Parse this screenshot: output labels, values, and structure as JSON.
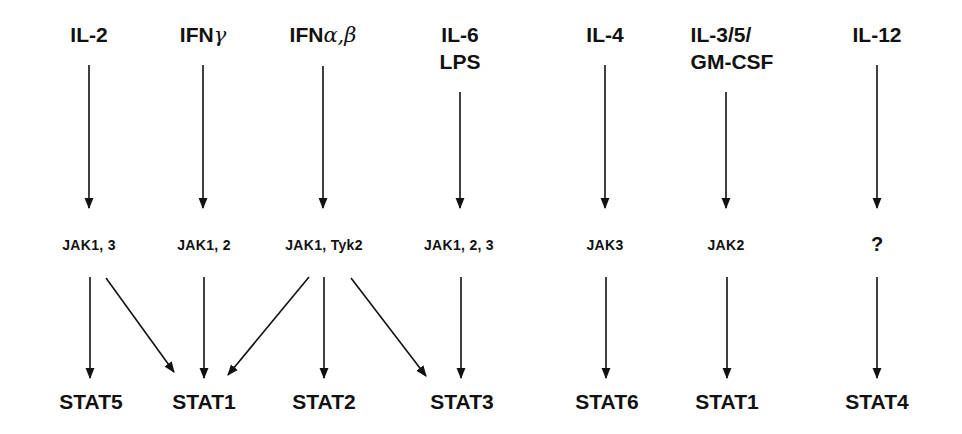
{
  "diagram": {
    "type": "cytokine-jak-stat-signaling",
    "columns": [
      {
        "id": "il2",
        "cytokine": [
          "IL-2"
        ],
        "jak": "JAK1, 3",
        "stats": [
          "STAT5",
          "STAT1"
        ]
      },
      {
        "id": "ifng",
        "cytokine_prefix": "IFN",
        "cytokine_greek": "γ",
        "jak": "JAK1, 2",
        "stats": [
          "STAT1"
        ]
      },
      {
        "id": "ifnab",
        "cytokine_prefix": "IFN",
        "cytokine_greek": "α,β",
        "jak": "JAK1, Tyk2",
        "stats": [
          "STAT1",
          "STAT2",
          "STAT3"
        ]
      },
      {
        "id": "il6",
        "cytokine": [
          "IL-6",
          "LPS"
        ],
        "jak": "JAK1, 2, 3",
        "stats": [
          "STAT3"
        ]
      },
      {
        "id": "il4",
        "cytokine": [
          "IL-4"
        ],
        "jak": "JAK3",
        "stats": [
          "STAT6"
        ]
      },
      {
        "id": "il3",
        "cytokine": [
          "IL-3/5/",
          "GM-CSF"
        ],
        "jak": "JAK2",
        "stats": [
          "STAT1"
        ]
      },
      {
        "id": "il12",
        "cytokine": [
          "IL-12"
        ],
        "jak": "?",
        "stats": [
          "STAT4"
        ]
      }
    ],
    "stat_labels": [
      "STAT5",
      "STAT1",
      "STAT2",
      "STAT3",
      "STAT6",
      "STAT1",
      "STAT4"
    ],
    "edges": [
      {
        "from": "IL-2",
        "to": "JAK1, 3"
      },
      {
        "from": "IFNγ",
        "to": "JAK1, 2"
      },
      {
        "from": "IFNα,β",
        "to": "JAK1, Tyk2"
      },
      {
        "from": "IL-6 LPS",
        "to": "JAK1, 2, 3"
      },
      {
        "from": "IL-4",
        "to": "JAK3"
      },
      {
        "from": "IL-3/5/GM-CSF",
        "to": "JAK2"
      },
      {
        "from": "IL-12",
        "to": "?"
      },
      {
        "from": "JAK1, 3",
        "to": "STAT5"
      },
      {
        "from": "JAK1, 3",
        "to": "STAT1"
      },
      {
        "from": "JAK1, 2",
        "to": "STAT1"
      },
      {
        "from": "JAK1, Tyk2",
        "to": "STAT1"
      },
      {
        "from": "JAK1, Tyk2",
        "to": "STAT2"
      },
      {
        "from": "JAK1, Tyk2",
        "to": "STAT3"
      },
      {
        "from": "JAK1, 2, 3",
        "to": "STAT3"
      },
      {
        "from": "JAK3",
        "to": "STAT6"
      },
      {
        "from": "JAK2",
        "to": "STAT1"
      },
      {
        "from": "?",
        "to": "STAT4"
      }
    ]
  }
}
